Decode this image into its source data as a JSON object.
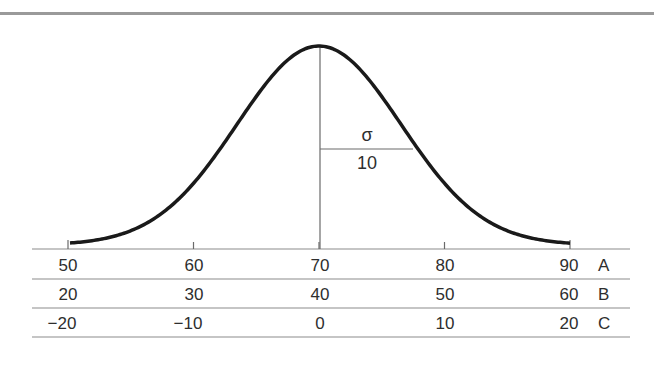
{
  "chart_data": {
    "type": "line",
    "title": "",
    "curve": {
      "mean": 70,
      "sigma": 10,
      "scale": "A"
    },
    "annotation": {
      "symbol": "σ",
      "value": "10"
    },
    "scales": [
      {
        "name": "A",
        "ticks": [
          "50",
          "60",
          "70",
          "80",
          "90"
        ]
      },
      {
        "name": "B",
        "ticks": [
          "20",
          "30",
          "40",
          "50",
          "60"
        ]
      },
      {
        "name": "C",
        "ticks": [
          "−20",
          "−10",
          "0",
          "10",
          "20"
        ]
      }
    ],
    "xlim": [
      50,
      90
    ],
    "grid": false,
    "legend": "none"
  },
  "colors": {
    "curve": "#1a1a1a",
    "rules": "#8c8c8c",
    "text": "#2e2e2e"
  }
}
